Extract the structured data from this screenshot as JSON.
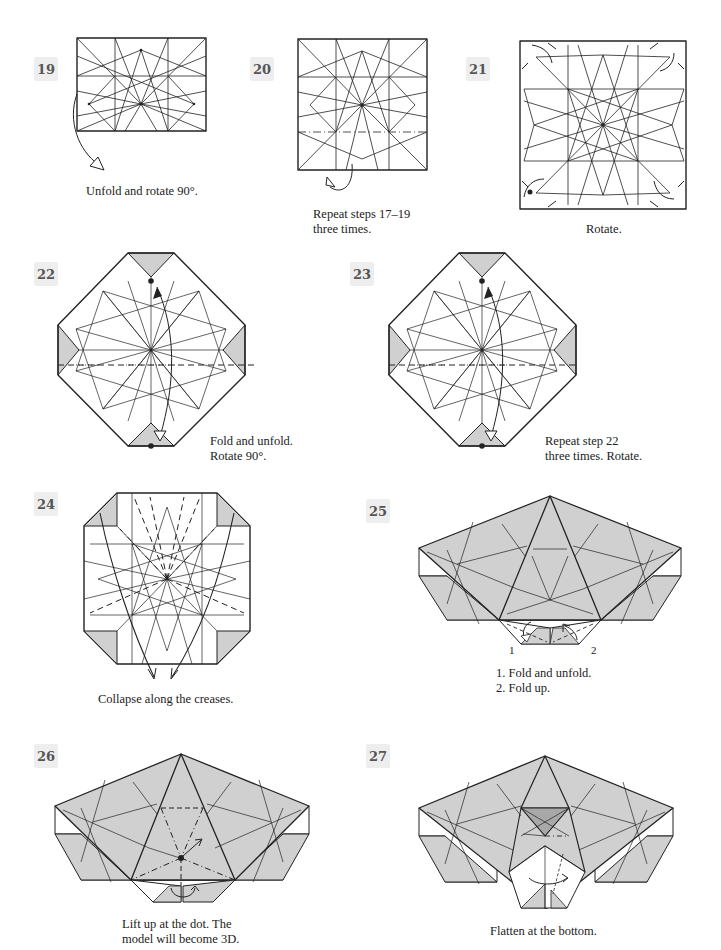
{
  "page": {
    "colors": {
      "paper": "#ffffff",
      "shade": "#d0d0d0",
      "dark_shade": "#a8a8a8",
      "line": "#222222",
      "step_badge_bg": "#eeeeee"
    },
    "steps": [
      {
        "number": "19",
        "caption": "Unfold and rotate 90°."
      },
      {
        "number": "20",
        "caption": "Repeat steps 17–19\nthree times."
      },
      {
        "number": "21",
        "caption": "Rotate."
      },
      {
        "number": "22",
        "caption": "Fold and unfold.\nRotate 90°."
      },
      {
        "number": "23",
        "caption": "Repeat step 22\nthree times. Rotate."
      },
      {
        "number": "24",
        "caption": "Collapse along the creases."
      },
      {
        "number": "25",
        "caption": "1. Fold and unfold.\n2. Fold up.",
        "labels": [
          "1",
          "2"
        ]
      },
      {
        "number": "26",
        "caption": "Lift up at the dot. The\nmodel will become 3D."
      },
      {
        "number": "27",
        "caption": "Flatten at the bottom."
      }
    ]
  }
}
